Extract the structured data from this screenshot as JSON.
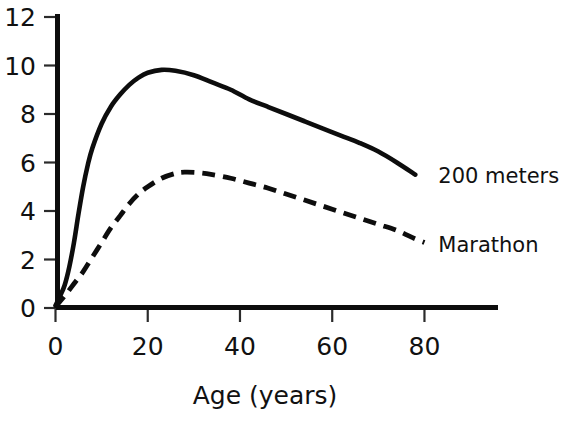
{
  "chart_data": {
    "type": "line",
    "title": "",
    "xlabel": "Age (years)",
    "ylabel": "",
    "xlim": [
      0,
      96
    ],
    "ylim": [
      0,
      12
    ],
    "grid": false,
    "legend_position": "right-inline",
    "x_ticks": [
      0,
      20,
      40,
      60,
      80
    ],
    "x_tick_labels": [
      "0",
      "20",
      "40",
      "60",
      "80"
    ],
    "y_ticks": [
      0,
      2,
      4,
      6,
      8,
      10,
      12
    ],
    "y_tick_labels": [
      "0",
      "2",
      "4",
      "6",
      "8",
      "10",
      "12"
    ],
    "series": [
      {
        "name": "200 meters",
        "style": "solid",
        "label_x": 83,
        "label_y": 5.45,
        "x": [
          0,
          1,
          2,
          3,
          4,
          5,
          6,
          7,
          8,
          10,
          12,
          14,
          16,
          18,
          20,
          23,
          26,
          30,
          34,
          38,
          42,
          46,
          50,
          54,
          58,
          62,
          66,
          70,
          74,
          78
        ],
        "y": [
          0.1,
          0.5,
          0.95,
          1.7,
          2.7,
          3.9,
          5.0,
          5.9,
          6.6,
          7.6,
          8.3,
          8.8,
          9.2,
          9.5,
          9.7,
          9.82,
          9.78,
          9.6,
          9.3,
          9.0,
          8.6,
          8.3,
          8.0,
          7.7,
          7.4,
          7.1,
          6.8,
          6.45,
          6.0,
          5.5
        ]
      },
      {
        "name": "Marathon",
        "style": "dashed",
        "label_x": 83,
        "label_y": 2.6,
        "x": [
          0,
          2,
          4,
          6,
          8,
          10,
          12,
          14,
          16,
          18,
          20,
          23,
          26,
          28,
          31,
          34,
          38,
          42,
          46,
          50,
          54,
          58,
          62,
          66,
          70,
          74,
          78,
          80
        ],
        "y": [
          0.05,
          0.5,
          1.0,
          1.5,
          2.1,
          2.7,
          3.3,
          3.8,
          4.3,
          4.7,
          5.0,
          5.35,
          5.55,
          5.6,
          5.58,
          5.5,
          5.35,
          5.15,
          4.95,
          4.7,
          4.45,
          4.2,
          3.95,
          3.7,
          3.45,
          3.2,
          2.85,
          2.7
        ]
      }
    ]
  },
  "labels": {
    "x_axis_title": "Age (years)",
    "series_200m": "200 meters",
    "series_marathon": "Marathon"
  },
  "colors": {
    "ink": "#0d0d0d",
    "background": "#ffffff"
  }
}
